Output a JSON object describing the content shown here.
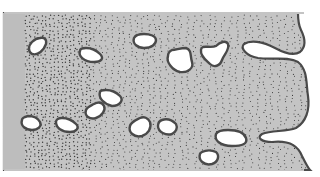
{
  "figure": {
    "width": 320,
    "height": 177,
    "colors": {
      "background": "#ffffff",
      "matrix": "#c4c4c4",
      "left_strip": "#bdbdbd",
      "stipple": "#3a3a3a",
      "void_fill": "#ffffff",
      "void_outline": "#4a4a4a"
    },
    "matrix_block": {
      "x": 4,
      "y": 13,
      "bottom": 170
    },
    "left_strip": {
      "x": 4,
      "width": 21
    },
    "right_boundary_path": "M4,13 L298,13 C298,18 298,24 301,30 C305,38 307,46 300,52 C294,56 286,54 275,48 C262,41 250,40 244,44 C240,48 246,56 258,58 C272,60 288,56 298,62 C308,70 306,84 308,96 C310,110 306,122 296,128 C286,132 272,130 262,134 C256,138 262,142 272,142 C290,140 298,146 302,156 C306,164 308,168 310,170 L4,170 Z",
    "voids": [
      {
        "name": "void-1",
        "d": "M32,42 C28,46 28,52 32,54 C38,56 44,50 46,44 C47,39 44,37 40,38 C36,38 34,40 32,42 Z"
      },
      {
        "name": "void-2",
        "d": "M80,51 C78,56 84,62 94,62 C102,62 104,58 100,54 C96,50 92,48 86,48 C82,48 80,49 80,51 Z"
      },
      {
        "name": "void-3",
        "d": "M134,38 C132,44 138,48 144,48 C152,48 156,44 156,40 C156,36 150,34 144,34 C138,34 135,36 134,38 Z"
      },
      {
        "name": "void-4",
        "d": "M168,56 C166,62 172,70 180,72 C188,73 194,68 192,62 C190,56 192,50 186,48 C180,48 176,50 172,50 C168,52 168,54 168,56 Z"
      },
      {
        "name": "void-5",
        "d": "M201,50 C200,56 206,60 210,64 C214,68 220,66 222,60 C224,54 230,50 228,44 C226,40 220,42 216,46 C212,48 206,46 203,47 C201,48 201,49 201,50 Z"
      },
      {
        "name": "void-6",
        "d": "M22,120 C20,126 26,130 32,130 C38,130 42,126 40,122 C38,118 34,116 28,116 C24,117 22,118 22,120 Z"
      },
      {
        "name": "void-7",
        "d": "M56,122 C56,128 62,132 70,132 C76,132 80,128 76,124 C72,120 68,118 62,118 C58,118 56,120 56,122 Z"
      },
      {
        "name": "void-8",
        "d": "M86,110 C84,116 90,120 96,118 C102,116 106,110 104,106 C102,102 98,102 94,104 C90,106 87,107 86,110 Z"
      },
      {
        "name": "void-9",
        "d": "M100,92 C98,98 104,104 112,106 C120,106 124,100 120,96 C116,92 110,90 106,90 C102,90 100,91 100,92 Z"
      },
      {
        "name": "void-10",
        "d": "M130,126 C128,132 134,138 142,136 C148,134 152,128 150,122 C148,118 144,116 140,118 C136,120 131,122 130,126 Z"
      },
      {
        "name": "void-11",
        "d": "M158,126 C158,132 166,136 172,134 C176,132 178,128 176,124 C172,120 168,118 162,120 C159,121 158,124 158,126 Z"
      },
      {
        "name": "void-12",
        "d": "M216,134 C214,140 220,146 232,146 C242,146 248,144 246,138 C244,132 236,130 228,130 C220,130 217,132 216,134 Z"
      },
      {
        "name": "void-13",
        "d": "M200,154 C198,160 204,166 212,164 C218,162 220,156 216,152 C212,150 206,150 202,152 C201,153 200,153 200,154 Z"
      }
    ],
    "stipple": {
      "dense_zone_end_x": 90,
      "spacing_dense": 4,
      "spacing_sparse": 6,
      "dot_radius": 0.55
    }
  }
}
